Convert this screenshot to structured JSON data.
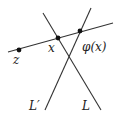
{
  "diagram": {
    "stroke_color": "#333333",
    "point_color": "#111111",
    "lines": [
      {
        "id": "transversal",
        "x1": 8,
        "y1": 52,
        "x2": 113,
        "y2": 23
      },
      {
        "id": "L",
        "x1": 43,
        "y1": 13,
        "x2": 101,
        "y2": 110
      },
      {
        "id": "L-prime",
        "x1": 91,
        "y1": 8,
        "x2": 45,
        "y2": 110
      }
    ],
    "points": [
      {
        "id": "z",
        "cx": 19,
        "cy": 50
      },
      {
        "id": "x",
        "cx": 58,
        "cy": 38
      },
      {
        "id": "phi-x",
        "cx": 80,
        "cy": 31
      }
    ],
    "labels": {
      "z": "z",
      "x": "x",
      "phi_x": "φ(x)",
      "L_prime": "L′",
      "L": "L"
    }
  }
}
